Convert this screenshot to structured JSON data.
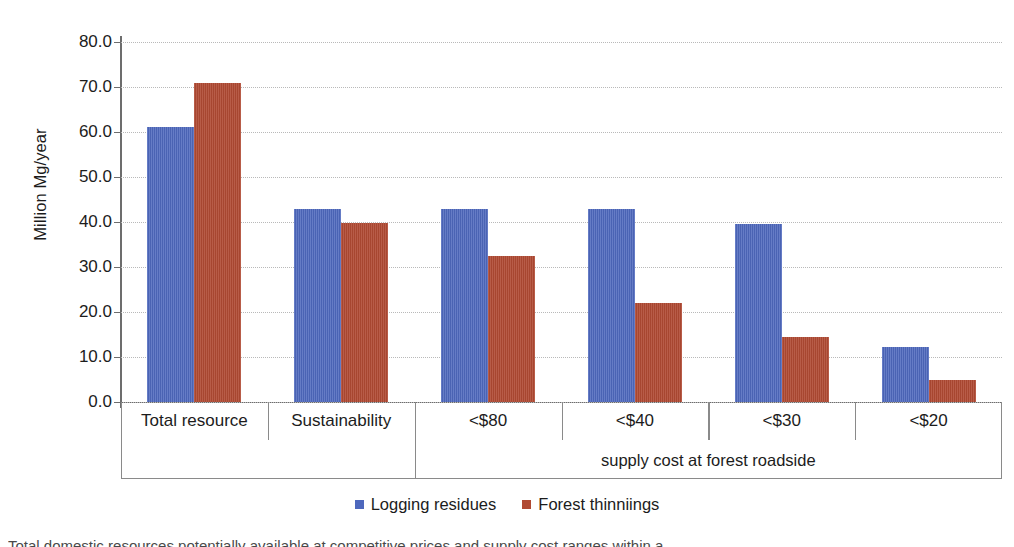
{
  "chart_data": {
    "type": "bar",
    "title": "",
    "subtitle": "",
    "xlabel": "supply cost at forest roadside",
    "ylabel": "Million Mg/year",
    "ylim": [
      0,
      80
    ],
    "ytick_labels": [
      "80.0",
      "70.0",
      "60.0",
      "50.0",
      "40.0",
      "30.0",
      "20.0",
      "10.0",
      "0.0"
    ],
    "ytick_values": [
      80,
      70,
      60,
      50,
      40,
      30,
      20,
      10,
      0
    ],
    "grid": true,
    "grid_style": "dotted",
    "legend_position": "bottom-center",
    "categories": [
      "Total resource",
      "Sustainability",
      "<$80",
      "<$40",
      "<$30",
      "<$20"
    ],
    "series": [
      {
        "name": "Logging residues",
        "color": "#4e68bd",
        "values": [
          61.2,
          42.8,
          42.8,
          42.8,
          39.6,
          12.3
        ]
      },
      {
        "name": "Forest thinniings",
        "color": "#b04a33",
        "values": [
          70.8,
          39.8,
          32.5,
          21.9,
          14.4,
          5.0
        ]
      }
    ],
    "annotations": [
      {
        "text": "supply cost at forest roadside",
        "spans_categories": [
          "<$80",
          "<$40",
          "<$30",
          "<$20"
        ]
      }
    ]
  },
  "axis": {
    "y_title": "Million Mg/year"
  },
  "legend": {
    "entries": [
      {
        "label": "Logging residues",
        "color": "#4e68bd",
        "swatch": "legend-swatch-blue"
      },
      {
        "label": "Forest thinniings",
        "color": "#b04a33",
        "swatch": "legend-swatch-red"
      }
    ]
  },
  "caption": {
    "text": "Total domestic resources potentially available at competitive prices and supply cost ranges within a"
  }
}
